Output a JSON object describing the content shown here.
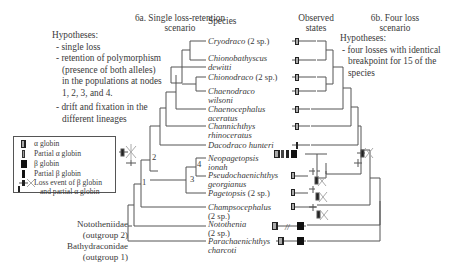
{
  "panel_a": {
    "title_line1": "6a. Single loss-retention",
    "title_line2": "scenario",
    "hypotheses_heading": "Hypotheses:",
    "hypotheses": [
      "- single loss",
      "- retention of polymorphism",
      "  (presence of both alleles)",
      "  in the populations at nodes",
      "  1, 2, 3, and 4.",
      "- drift and fixation in the",
      "  different lineages"
    ]
  },
  "panel_b": {
    "title_line1": "6b. Four loss",
    "title_line2": "scenario",
    "hypotheses_heading": "Hypotheses:",
    "hypotheses": [
      "- four losses with identical",
      "  breakpoint for 15 of the",
      "  species"
    ]
  },
  "columns": {
    "species": "Species",
    "observed_line1": "Observed",
    "observed_line2": "states"
  },
  "species": [
    {
      "name": "Cryodraco",
      "suffix": " (2 sp.)",
      "state": "alpha-partial"
    },
    {
      "name": "Chionobathyscus",
      "name2": "dewitti",
      "state": "alpha-partial"
    },
    {
      "name": "Chionodraco",
      "suffix": " (2 sp.)",
      "state": "alpha-partial"
    },
    {
      "name": "Chaenodraco",
      "name2": "wilsoni",
      "state": "alpha-partial"
    },
    {
      "name": "Chaenocephalus",
      "name2": "aceratus",
      "state": "alpha-partial"
    },
    {
      "name": "Channichthys",
      "name2": "rhinoceratus",
      "state": "alpha-partial"
    },
    {
      "name": "Dacodraco hunteri",
      "state": "partial-alpha-only"
    },
    {
      "name": "Neopagetopsis",
      "name2": "ionah",
      "state": "alpha-beta-partial-beta"
    },
    {
      "name": "Pseudochaenichthys",
      "name2": "georgianus",
      "state": "alpha-partial"
    },
    {
      "name": "Pagetopsis",
      "suffix": " (2 sp.)",
      "state": "alpha-partial"
    },
    {
      "name": "Champsocephalus",
      "name2": "(2 sp.)",
      "state": "alpha-partial"
    },
    {
      "name": "Notothenia",
      "name2": "(2 sp.)",
      "state": "alpha-beta"
    },
    {
      "name": "Parachaenichthys",
      "name2": "charcoti",
      "state": "alpha-beta"
    }
  ],
  "outgroups": [
    {
      "line1": "Nototheniidae",
      "line2": "(outgroup 2)"
    },
    {
      "line1": "Bathydraconidae",
      "line2": "(outgroup 1)"
    }
  ],
  "node_labels": [
    "1",
    "2",
    "3",
    "4"
  ],
  "legend": [
    {
      "symbol": "alpha-globin",
      "label": "α globin"
    },
    {
      "symbol": "partial-alpha-globin",
      "label": "Partial α globin"
    },
    {
      "symbol": "beta-globin",
      "label": "β globin"
    },
    {
      "symbol": "partial-beta-globin",
      "label": "Partial β globin"
    },
    {
      "symbol": "loss-event",
      "label": "Loss event of β globin",
      "label2": "and partial α globin"
    }
  ],
  "colors": {
    "line": "#555555",
    "text": "#3a3a3a",
    "gene_dark": "#1a1a1a",
    "gene_light": "#9a9a9a"
  }
}
